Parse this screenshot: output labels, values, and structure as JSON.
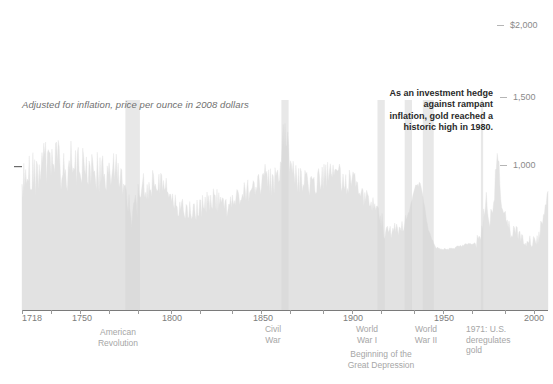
{
  "chart_data": {
    "type": "area",
    "title": "",
    "subtitle": "Adjusted for inflation, price per ounce in 2008 dollars",
    "xlabel": "",
    "ylabel": "",
    "xlim": [
      1718,
      2008
    ],
    "ylim": [
      0,
      2150
    ],
    "grid": false,
    "legend": null,
    "area_color": "#e2e2e2",
    "y_ticks": [
      {
        "value": 2000,
        "label": "$2,000"
      },
      {
        "value": 1500,
        "label": "1,500"
      },
      {
        "value": 1000,
        "label": "1,000"
      }
    ],
    "x_ticks": [
      {
        "value": 1718,
        "label": "1718"
      },
      {
        "value": 1750,
        "label": "1750"
      },
      {
        "value": 1800,
        "label": "1800"
      },
      {
        "value": 1850,
        "label": "1850"
      },
      {
        "value": 1900,
        "label": "1900"
      },
      {
        "value": 1950,
        "label": "1950"
      },
      {
        "value": 2000,
        "label": "2000"
      }
    ],
    "annotations": [
      {
        "name": "investment-hedge-note",
        "text": "As an investment hedge against rampant inflation, gold reached a historic high in 1980."
      }
    ],
    "events": [
      {
        "name": "american-revolution",
        "label": "American Revolution",
        "x": 1776
      },
      {
        "name": "civil-war",
        "label": "Civil War",
        "x": 1863
      },
      {
        "name": "world-war-i",
        "label": "World War I",
        "x": 1916
      },
      {
        "name": "great-depression",
        "label": "Beginning of the Great Depression",
        "x": 1929
      },
      {
        "name": "world-war-ii",
        "label": "World War II",
        "x": 1942
      },
      {
        "name": "gold-deregulation",
        "label": "1971: U.S. deregulates gold",
        "x": 1971
      }
    ],
    "x": [
      1718,
      1722,
      1726,
      1730,
      1734,
      1738,
      1742,
      1746,
      1750,
      1754,
      1758,
      1762,
      1766,
      1770,
      1774,
      1776,
      1778,
      1780,
      1784,
      1788,
      1792,
      1796,
      1800,
      1804,
      1808,
      1812,
      1816,
      1820,
      1824,
      1828,
      1832,
      1836,
      1840,
      1844,
      1848,
      1852,
      1856,
      1860,
      1863,
      1866,
      1870,
      1874,
      1878,
      1882,
      1886,
      1890,
      1894,
      1898,
      1902,
      1906,
      1910,
      1914,
      1918,
      1922,
      1926,
      1929,
      1932,
      1935,
      1938,
      1942,
      1946,
      1950,
      1954,
      1958,
      1962,
      1966,
      1970,
      1971,
      1974,
      1976,
      1978,
      1980,
      1982,
      1984,
      1986,
      1988,
      1992,
      1996,
      2000,
      2002,
      2004,
      2006,
      2008
    ],
    "values": [
      880,
      960,
      905,
      1000,
      935,
      1010,
      890,
      1045,
      950,
      1020,
      900,
      965,
      870,
      955,
      860,
      760,
      600,
      660,
      840,
      890,
      905,
      870,
      800,
      700,
      690,
      660,
      700,
      740,
      760,
      720,
      700,
      745,
      790,
      830,
      870,
      900,
      870,
      930,
      1250,
      980,
      900,
      880,
      860,
      890,
      920,
      950,
      900,
      870,
      840,
      800,
      770,
      720,
      520,
      540,
      560,
      600,
      700,
      880,
      860,
      560,
      430,
      420,
      420,
      440,
      450,
      455,
      470,
      520,
      760,
      620,
      700,
      1150,
      800,
      640,
      560,
      540,
      520,
      480,
      460,
      470,
      560,
      700,
      880
    ]
  }
}
